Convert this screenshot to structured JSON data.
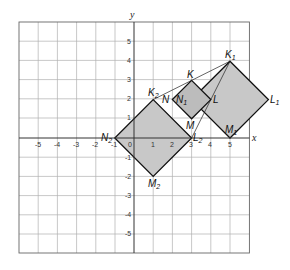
{
  "figure": {
    "axes": {
      "x_label": "x",
      "y_label": "y",
      "x_range": [
        -6,
        6
      ],
      "y_range": [
        -6,
        6
      ],
      "x_ticks": [
        "-5",
        "-4",
        "-3",
        "-2",
        "-1",
        "0",
        "1",
        "2",
        "3",
        "4",
        "5"
      ],
      "y_ticks": [
        "5",
        "4",
        "3",
        "2",
        "1",
        "-1",
        "-2",
        "-3",
        "-4",
        "-5"
      ]
    },
    "colors": {
      "grid": "#aaaaaa",
      "axis": "#333333",
      "fill": "#c8c8c8",
      "stroke": "#111111"
    },
    "squares": [
      {
        "name": "KLMN",
        "vertices": {
          "K": [
            3,
            3
          ],
          "L": [
            4,
            2
          ],
          "M": [
            3,
            1
          ],
          "N": [
            2,
            2
          ]
        }
      },
      {
        "name": "K1L1M1N1",
        "vertices": {
          "K1": [
            5,
            4
          ],
          "L1": [
            7,
            2
          ],
          "M1": [
            5,
            0
          ],
          "N1": [
            3,
            2
          ]
        }
      },
      {
        "name": "K2L2M2N2",
        "vertices": {
          "K2": [
            1,
            2
          ],
          "L2": [
            3,
            0
          ],
          "M2": [
            1,
            -2
          ],
          "N2": [
            -1,
            0
          ]
        }
      }
    ],
    "lines": [
      {
        "from": "K1",
        "to": "K2"
      },
      {
        "from": "K1",
        "to": "L2"
      }
    ],
    "labels": {
      "K": "K",
      "L": "L",
      "M": "M",
      "N": "N",
      "K1": "K",
      "L1": "L",
      "M1": "M",
      "N1": "N",
      "sub1": "1",
      "K2": "K",
      "L2": "L",
      "M2": "M",
      "N2": "N",
      "sub2": "2"
    }
  }
}
